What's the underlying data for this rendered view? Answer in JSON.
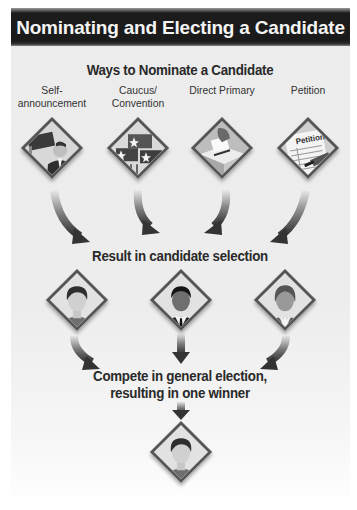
{
  "header": {
    "title": "Nominating and Electing a Candidate"
  },
  "nomination": {
    "title": "Ways to Nominate a Candidate",
    "methods": [
      {
        "label_line1": "Self-",
        "label_line2": "announcement",
        "icon": "self-announcement-icon"
      },
      {
        "label_line1": "Caucus/",
        "label_line2": "Convention",
        "icon": "caucus-flags-icon"
      },
      {
        "label_line1": "Direct Primary",
        "label_line2": "",
        "icon": "ballot-box-icon"
      },
      {
        "label_line1": "Petition",
        "label_line2": "",
        "icon": "petition-icon"
      }
    ],
    "petition_sign_text": "Petition"
  },
  "selection": {
    "title": "Result in candidate selection",
    "candidates": [
      {
        "icon": "female-candidate-icon"
      },
      {
        "icon": "male-candidate-icon"
      },
      {
        "icon": "older-female-candidate-icon"
      }
    ]
  },
  "election": {
    "title_line1": "Compete in general election,",
    "title_line2": "resulting in one winner",
    "winner": {
      "icon": "winner-candidate-icon"
    }
  },
  "colors": {
    "header_bg": "#1a1a1a",
    "header_text": "#f4f4f4",
    "panel_bg": "#ececec",
    "text": "#2a2a2a",
    "diamond_border": "#555555",
    "arrow": "#3a3a3a"
  }
}
